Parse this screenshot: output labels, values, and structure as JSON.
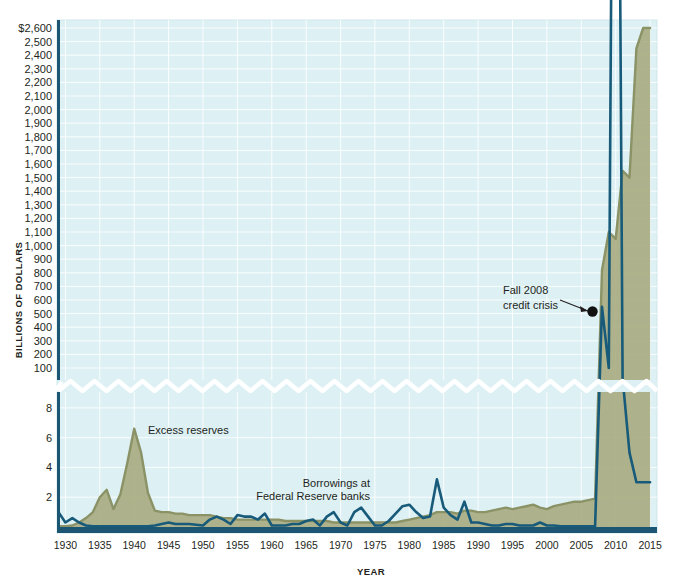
{
  "chart_data": {
    "type": "area",
    "title": "",
    "xlabel": "YEAR",
    "ylabel": "BILLIONS OF DOLLARS",
    "grid": true,
    "legend_position": "inline-annotations",
    "axis_break": {
      "present": true,
      "style": "zigzag",
      "between": [
        8,
        100
      ],
      "note": "y-axis broken between the lower 0-8 scale and the upper 100-2,600 scale"
    },
    "xlim": [
      1929,
      2016
    ],
    "x_ticks": [
      "1930",
      "1935",
      "1940",
      "1945",
      "1950",
      "1955",
      "1960",
      "1965",
      "1970",
      "1975",
      "1980",
      "1985",
      "1990",
      "1995",
      "2000",
      "2005",
      "2010",
      "2015"
    ],
    "y_ticks_upper": [
      "$2,600",
      "2,500",
      "2,400",
      "2,300",
      "2,200",
      "2,100",
      "2,000",
      "1,900",
      "1,800",
      "1,700",
      "1,600",
      "1,500",
      "1,400",
      "1,300",
      "1,200",
      "1,100",
      "1,000",
      "900",
      "800",
      "700",
      "600",
      "500",
      "400",
      "300",
      "200",
      "100"
    ],
    "y_ticks_lower": [
      "8",
      "6",
      "4",
      "2"
    ],
    "ylim_upper": [
      100,
      2600
    ],
    "ylim_lower": [
      0,
      9
    ],
    "series": [
      {
        "name": "Excess reserves",
        "color": "#8a9266",
        "fill": "#a9ad82",
        "type": "area",
        "x": [
          1929,
          1930,
          1931,
          1932,
          1933,
          1934,
          1935,
          1936,
          1937,
          1938,
          1939,
          1940,
          1941,
          1942,
          1943,
          1944,
          1945,
          1946,
          1947,
          1948,
          1949,
          1950,
          1951,
          1952,
          1953,
          1954,
          1955,
          1956,
          1957,
          1958,
          1959,
          1960,
          1961,
          1962,
          1963,
          1964,
          1965,
          1966,
          1967,
          1968,
          1969,
          1970,
          1971,
          1972,
          1973,
          1974,
          1975,
          1976,
          1977,
          1978,
          1979,
          1980,
          1981,
          1982,
          1983,
          1984,
          1985,
          1986,
          1987,
          1988,
          1989,
          1990,
          1991,
          1992,
          1993,
          1994,
          1995,
          1996,
          1997,
          1998,
          1999,
          2000,
          2001,
          2002,
          2003,
          2004,
          2005,
          2006,
          2007,
          2008,
          2009,
          2010,
          2011,
          2012,
          2013,
          2014,
          2015
        ],
        "values": [
          0.05,
          0.05,
          0.1,
          0.3,
          0.6,
          1.0,
          2.0,
          2.5,
          1.2,
          2.2,
          4.3,
          6.6,
          5.0,
          2.3,
          1.1,
          1.0,
          1.0,
          0.9,
          0.9,
          0.8,
          0.8,
          0.8,
          0.8,
          0.7,
          0.6,
          0.6,
          0.5,
          0.5,
          0.5,
          0.5,
          0.5,
          0.5,
          0.5,
          0.4,
          0.4,
          0.4,
          0.4,
          0.4,
          0.4,
          0.4,
          0.3,
          0.3,
          0.3,
          0.3,
          0.3,
          0.3,
          0.3,
          0.3,
          0.3,
          0.3,
          0.4,
          0.5,
          0.6,
          0.7,
          0.8,
          1.0,
          1.0,
          1.0,
          0.9,
          1.1,
          1.1,
          1.0,
          1.0,
          1.1,
          1.2,
          1.3,
          1.2,
          1.3,
          1.4,
          1.5,
          1.3,
          1.2,
          1.4,
          1.5,
          1.6,
          1.7,
          1.7,
          1.8,
          1.9,
          820,
          1100,
          1050,
          1550,
          1500,
          2450,
          2600,
          2600
        ],
        "peak_1940": 6.6,
        "note": "Values pre-2008 read on the lower (0-8) scale; 2008 onward on the upper (100-2,600 billion) scale"
      },
      {
        "name": "Borrowings at Federal Reserve banks",
        "color": "#185a79",
        "fill": "#1a5f7f",
        "type": "line",
        "x": [
          1929,
          1930,
          1931,
          1932,
          1933,
          1934,
          1935,
          1936,
          1937,
          1938,
          1939,
          1940,
          1941,
          1942,
          1943,
          1944,
          1945,
          1946,
          1947,
          1948,
          1949,
          1950,
          1951,
          1952,
          1953,
          1954,
          1955,
          1956,
          1957,
          1958,
          1959,
          1960,
          1961,
          1962,
          1963,
          1964,
          1965,
          1966,
          1967,
          1968,
          1969,
          1970,
          1971,
          1972,
          1973,
          1974,
          1975,
          1976,
          1977,
          1978,
          1979,
          1980,
          1981,
          1982,
          1983,
          1984,
          1985,
          1986,
          1987,
          1988,
          1989,
          1990,
          1991,
          1992,
          1993,
          1994,
          1995,
          1996,
          1997,
          1998,
          1999,
          2000,
          2001,
          2002,
          2003,
          2004,
          2005,
          2006,
          2007,
          2008,
          2009,
          2010,
          2011,
          2012,
          2013,
          2014,
          2015
        ],
        "values": [
          1.0,
          0.3,
          0.6,
          0.3,
          0.1,
          0.05,
          0.05,
          0.05,
          0.05,
          0.05,
          0.05,
          0.05,
          0.05,
          0.05,
          0.1,
          0.2,
          0.3,
          0.2,
          0.2,
          0.2,
          0.15,
          0.1,
          0.5,
          0.7,
          0.5,
          0.2,
          0.8,
          0.7,
          0.7,
          0.5,
          0.9,
          0.1,
          0.1,
          0.1,
          0.2,
          0.2,
          0.4,
          0.5,
          0.1,
          0.7,
          1.0,
          0.3,
          0.1,
          1.0,
          1.3,
          0.7,
          0.1,
          0.1,
          0.4,
          0.9,
          1.4,
          1.5,
          1.0,
          0.6,
          0.7,
          3.2,
          1.3,
          0.8,
          0.5,
          1.7,
          0.3,
          0.3,
          0.2,
          0.1,
          0.1,
          0.2,
          0.2,
          0.1,
          0.1,
          0.1,
          0.3,
          0.1,
          0.1,
          0.05,
          0.05,
          0.05,
          0.05,
          0.05,
          0.05,
          550,
          100,
          85,
          10,
          5,
          3,
          3,
          3
        ],
        "peak_2008": 550,
        "note": "Spikes to roughly $550 billion in Fall 2008, then collapses"
      }
    ],
    "annotations": [
      {
        "name": "excess-reserves-label",
        "text": "Excess reserves",
        "x": 1939,
        "y": 6.0
      },
      {
        "name": "borrowings-label",
        "text": "Borrowings at\nFederal Reserve banks",
        "line1": "Borrowings at",
        "line2": "Federal Reserve banks",
        "x": 1962,
        "y": 3.0
      },
      {
        "name": "credit-crisis-label",
        "text": "Fall 2008\ncredit crisis",
        "line1": "Fall 2008",
        "line2": "credit crisis",
        "points_to_x": 2008,
        "points_to_y": 560,
        "marker": "black-dot"
      }
    ],
    "colors": {
      "plot_background": "#ddf0f4",
      "gridline": "#ffffff",
      "axis": "#1d5673",
      "excess_reserves_line": "#8a9266",
      "excess_reserves_fill": "#a9ad82",
      "borrowings_line": "#185a79",
      "text": "#231f20"
    }
  }
}
